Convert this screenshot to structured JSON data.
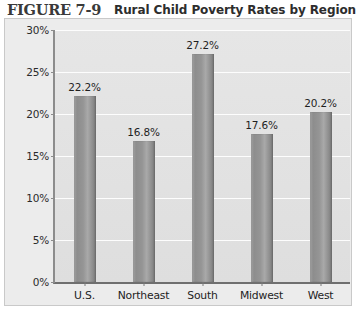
{
  "header": {
    "figure_number": "FIGURE 7-9",
    "title": "Rural Child Poverty Rates by Region"
  },
  "colors": {
    "bar_fill": "#8d8d8d",
    "bar_edge": "#6e6e6e",
    "plot_background": "#e3e3e3",
    "frame_background": "#ececec",
    "gridline": "#fdfdfd",
    "axis_line": "#7a7a7a",
    "text": "#232323"
  },
  "chart_data": {
    "type": "bar",
    "title": "Rural Child Poverty Rates by Region",
    "xlabel": "",
    "ylabel": "",
    "categories": [
      "U.S.",
      "Northeast",
      "South",
      "Midwest",
      "West"
    ],
    "values": [
      22.2,
      16.8,
      27.2,
      17.6,
      20.2
    ],
    "value_labels": [
      "22.2%",
      "16.8%",
      "27.2%",
      "17.6%",
      "20.2%"
    ],
    "ylim": [
      0,
      30
    ],
    "ytick_values": [
      0,
      5,
      10,
      15,
      20,
      25,
      30
    ],
    "ytick_labels": [
      "0%",
      "5%",
      "10%",
      "15%",
      "20%",
      "25%",
      "30%"
    ],
    "grid": true,
    "legend": null,
    "legend_position": "none",
    "series": [
      {
        "name": "Rural child poverty rate",
        "values": [
          22.2,
          16.8,
          27.2,
          17.6,
          20.2
        ]
      }
    ]
  }
}
